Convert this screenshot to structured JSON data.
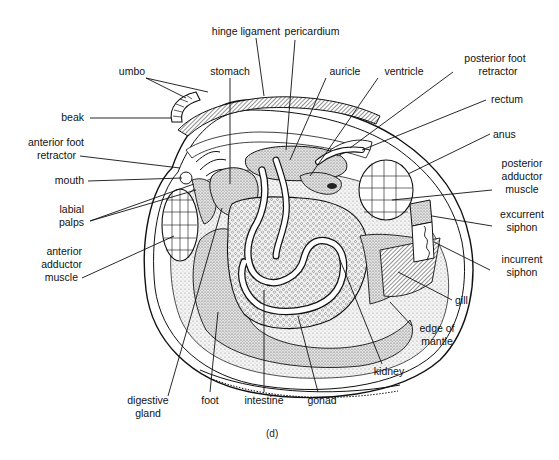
{
  "figure": {
    "caption": "(d)",
    "labels": {
      "hinge_ligament": "hinge ligament",
      "pericardium": "pericardium",
      "umbo": "umbo",
      "stomach": "stomach",
      "auricle": "auricle",
      "ventricle": "ventricle",
      "posterior_foot_retractor_1": "posterior foot",
      "posterior_foot_retractor_2": "retractor",
      "beak": "beak",
      "rectum": "rectum",
      "anterior_foot_retractor_1": "anterior foot",
      "anterior_foot_retractor_2": "retractor",
      "anus": "anus",
      "mouth": "mouth",
      "posterior_adductor_1": "posterior",
      "posterior_adductor_2": "adductor",
      "posterior_adductor_3": "muscle",
      "labial_palps_1": "labial",
      "labial_palps_2": "palps",
      "excurrent_siphon_1": "excurrent",
      "excurrent_siphon_2": "siphon",
      "anterior_adductor_1": "anterior",
      "anterior_adductor_2": "adductor",
      "anterior_adductor_3": "muscle",
      "incurrent_siphon_1": "incurrent",
      "incurrent_siphon_2": "siphon",
      "gill": "gill",
      "edge_of_mantle_1": "edge of",
      "edge_of_mantle_2": "mantle",
      "kidney": "kidney",
      "digestive_gland_1": "digestive",
      "digestive_gland_2": "gland",
      "foot": "foot",
      "intestine": "intestine",
      "gonad": "gonad"
    },
    "colors": {
      "ink": "#111111",
      "stipple": "#bdbdbd",
      "background": "#ffffff"
    }
  }
}
